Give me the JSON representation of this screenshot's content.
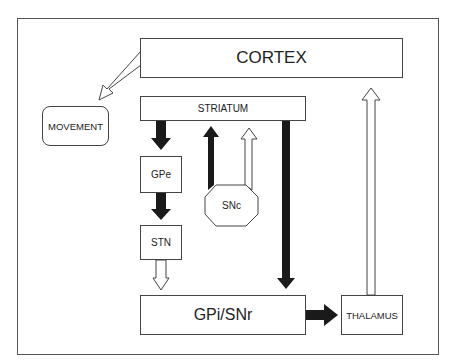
{
  "diagram": {
    "nodes": {
      "cortex": "CORTEX",
      "striatum": "STRIATUM",
      "movement": "MOVEMENT",
      "gpe": "GPe",
      "stn": "STN",
      "snc": "SNc",
      "gpi_snr": "GPi/SNr",
      "thalamus": "THALAMUS"
    },
    "edges": [
      {
        "from": "CORTEX",
        "to": "MOVEMENT",
        "style": "open"
      },
      {
        "from": "STRIATUM",
        "to": "GPe",
        "style": "filled"
      },
      {
        "from": "GPe",
        "to": "STN",
        "style": "filled"
      },
      {
        "from": "STN",
        "to": "GPi/SNr",
        "style": "open"
      },
      {
        "from": "SNc",
        "to": "STRIATUM",
        "style": "filled"
      },
      {
        "from": "SNc",
        "to": "STRIATUM",
        "style": "open"
      },
      {
        "from": "STRIATUM",
        "to": "GPi/SNr",
        "style": "filled"
      },
      {
        "from": "GPi/SNr",
        "to": "THALAMUS",
        "style": "filled"
      },
      {
        "from": "THALAMUS",
        "to": "CORTEX",
        "style": "open"
      }
    ],
    "legend_colors": {
      "filled": "#1a1a1a",
      "open": "#ffffff",
      "stroke": "#444444"
    }
  }
}
